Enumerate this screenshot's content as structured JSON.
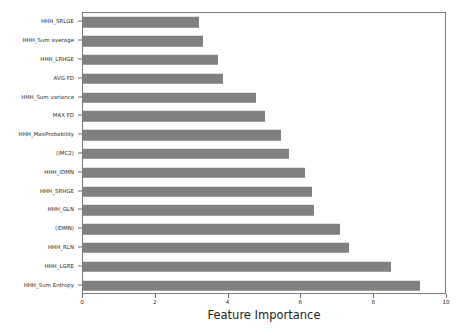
{
  "chart_data": {
    "type": "bar",
    "orientation": "horizontal",
    "title": "",
    "xlabel": "Feature Importance",
    "ylabel": "",
    "xlim": [
      0,
      10
    ],
    "xticks": [
      0,
      2,
      4,
      6,
      8,
      10
    ],
    "xtick_labels": [
      "0",
      "2",
      "4",
      "6",
      "8",
      "10"
    ],
    "grid": false,
    "legend": null,
    "bar_color": "#808080",
    "categories": [
      "HHH_SRLGE",
      "HHH_Sum average",
      "HHH_LRHGE",
      "AVG FD",
      "HHH_Sum variance",
      "MAX FD",
      "HHH_MaxProbability",
      "(IMC2)",
      "HHH_IDMN",
      "HHH_SRHGE",
      "HHH_GLN",
      "(IDMN)",
      "HHH_RLN",
      "HHH_LGRE",
      "HHH_Sum Entropy"
    ],
    "values": [
      3.2,
      3.3,
      3.7,
      3.85,
      4.75,
      5.0,
      5.45,
      5.65,
      6.1,
      6.3,
      6.35,
      7.05,
      7.3,
      8.45,
      9.25
    ]
  },
  "colors": {
    "bar": "#808080",
    "axis": "#7a7a7a",
    "text": "#2b2b2b",
    "background": "#ffffff"
  }
}
